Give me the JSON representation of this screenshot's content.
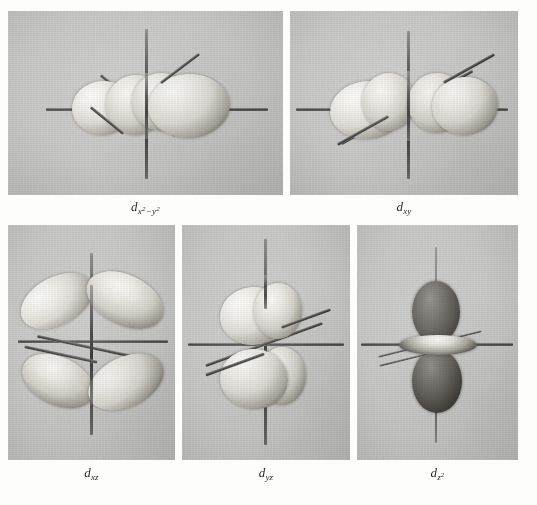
{
  "figure": {
    "kind": "photographic-plate",
    "background_color": "#fdfdfc",
    "panel_background_color": "#c9c9c7",
    "rows": 2
  },
  "panels": [
    {
      "id": "d-x2-y2",
      "row": 1,
      "caption": {
        "symbol": "d",
        "subscript": "x",
        "sub_sup_1": "2",
        "minus": "−",
        "subscript2": "y",
        "sub_sup_2": "2",
        "full": "d x²−y²"
      },
      "orbital": "d_x2-y2",
      "lobe_count": 4,
      "lobe_shade": "pale",
      "view": "near edge-on along z, lobes along x and y axes",
      "axes": [
        "z-vertical",
        "x-horizontal",
        "y-diagonal-down-left"
      ]
    },
    {
      "id": "d-xy",
      "row": 1,
      "caption": {
        "symbol": "d",
        "subscript": "xy",
        "full": "d xy"
      },
      "orbital": "d_xy",
      "lobe_count": 4,
      "lobe_shade": "pale",
      "view": "near edge-on, lobes between x and y axes",
      "axes": [
        "z-vertical",
        "x-horizontal",
        "y-diagonal-up-right"
      ]
    },
    {
      "id": "d-xz",
      "row": 2,
      "caption": {
        "symbol": "d",
        "subscript": "xz",
        "full": "d xz"
      },
      "orbital": "d_xz",
      "lobe_count": 4,
      "lobe_shade": "pale",
      "view": "face-on four-lobed clover in the xz plane",
      "axes": [
        "z-vertical",
        "x-horizontal",
        "y-diagonal-down-left"
      ]
    },
    {
      "id": "d-yz",
      "row": 2,
      "caption": {
        "symbol": "d",
        "subscript": "yz",
        "full": "d yz"
      },
      "orbital": "d_yz",
      "lobe_count": 4,
      "lobe_shade": "pale",
      "view": "near edge-on, lobes in the yz plane",
      "axes": [
        "z-vertical",
        "x-horizontal",
        "y-diagonal-up-right"
      ]
    },
    {
      "id": "d-z2",
      "row": 2,
      "caption": {
        "symbol": "d",
        "subscript": "z",
        "sub_sup": "2",
        "full": "d z²"
      },
      "orbital": "d_z2",
      "lobe_count": 2,
      "lobe_shade": "dark",
      "has_torus": true,
      "view": "two dark lobes along z with an equatorial collar (torus)",
      "axes": [
        "z-vertical",
        "x-horizontal",
        "y-diagonal-down-left"
      ]
    }
  ]
}
